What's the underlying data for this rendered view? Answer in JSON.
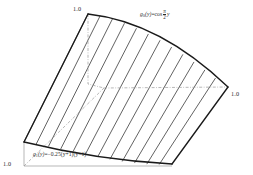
{
  "figure": {
    "background_color": "#ffffff",
    "outline_color": "#1a1a1a",
    "hatch_color": "#3a3a3a",
    "dash_color": "#8a8a8a",
    "text_color": "#2b2b2b"
  },
  "axis_labels": {
    "top_left": "1.0",
    "right": "1.0",
    "bottom_left": "1.0"
  },
  "formulas": {
    "g0": {
      "name": "g",
      "subscript": "0",
      "argument": "(y)",
      "equals": "=cos",
      "numerator": "π",
      "denominator": "2",
      "tail": "y",
      "plain": "g0(y)=cos (π/2) y"
    },
    "g1": {
      "name": "g",
      "subscript": "1",
      "argument": "(y)",
      "expression": "=−0.25(y+1)(y−1)",
      "plain": "g1(y)=-0.25(y+1)(y-1)"
    }
  },
  "geometry": {
    "vertices": {
      "top_left": [
        88,
        14
      ],
      "right": [
        228,
        87
      ],
      "bottom_right": [
        172,
        164
      ],
      "bottom_left": [
        24,
        142
      ]
    },
    "hatch_line_count": 12,
    "curves": {
      "top_edge": "convex arc from top-left vertex to right vertex",
      "bottom_edge": "shallow concave arc from bottom-left vertex to bottom-right vertex",
      "left_edge": "straight from bottom-left to top-left",
      "right_edge": "straight from bottom-right to right vertex"
    },
    "reference_lines": {
      "vertical_dash_dot": "from top-left vertex downward then turning right",
      "horizontal_dash_dot": "from interior leftward point to right vertex",
      "diagonal_dash_dot": "from bottom-left corner toward interior upper-right"
    }
  }
}
